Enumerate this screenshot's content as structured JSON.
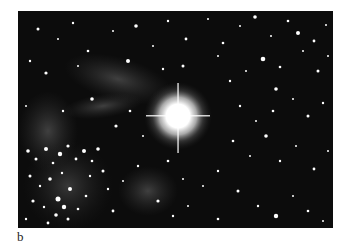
{
  "figure": {
    "panel_label": "b",
    "image": {
      "subject": "star field with bright central star",
      "background_color": "#0c0c0c",
      "star_color": "#ffffff",
      "nebula_color": "#6a6a6a"
    }
  }
}
